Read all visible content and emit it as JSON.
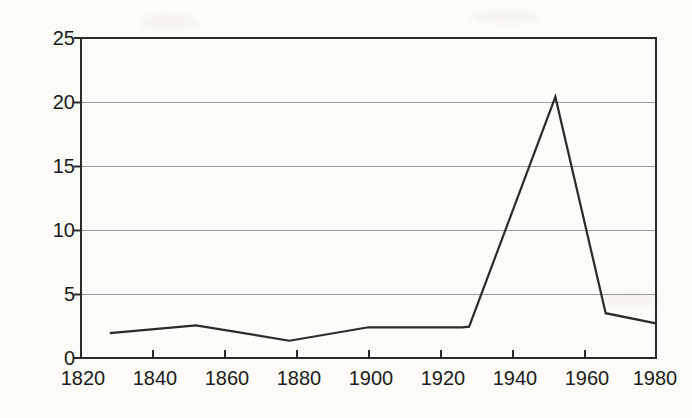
{
  "chart_data": {
    "type": "line",
    "title": "",
    "subtitle": "",
    "xlabel": "",
    "ylabel": "Quecksilber (µg/g)",
    "xlim": [
      1820,
      1980
    ],
    "ylim": [
      0,
      25
    ],
    "grid": true,
    "legend": null,
    "xticks": [
      1820,
      1840,
      1860,
      1880,
      1900,
      1920,
      1940,
      1960,
      1980
    ],
    "yticks": [
      0,
      5,
      10,
      15,
      20,
      25
    ],
    "xtick_labels": [
      "1820",
      "1840",
      "1860",
      "1880",
      "1900",
      "1920",
      "1940",
      "1960",
      "1980"
    ],
    "ytick_labels": [
      "0",
      "5",
      "10",
      "15",
      "20",
      "25"
    ],
    "series": [
      {
        "name": "Quecksilber",
        "color": "#2b2b2b",
        "x": [
          1828,
          1852,
          1878,
          1900,
          1906,
          1926,
          1928,
          1952,
          1966,
          1980
        ],
        "values": [
          1.95,
          2.55,
          1.35,
          2.4,
          2.4,
          2.4,
          2.45,
          20.4,
          3.5,
          2.7
        ]
      }
    ],
    "annotations": []
  },
  "axis": {
    "y_label_text": "Quecksilber (µg/g)"
  }
}
